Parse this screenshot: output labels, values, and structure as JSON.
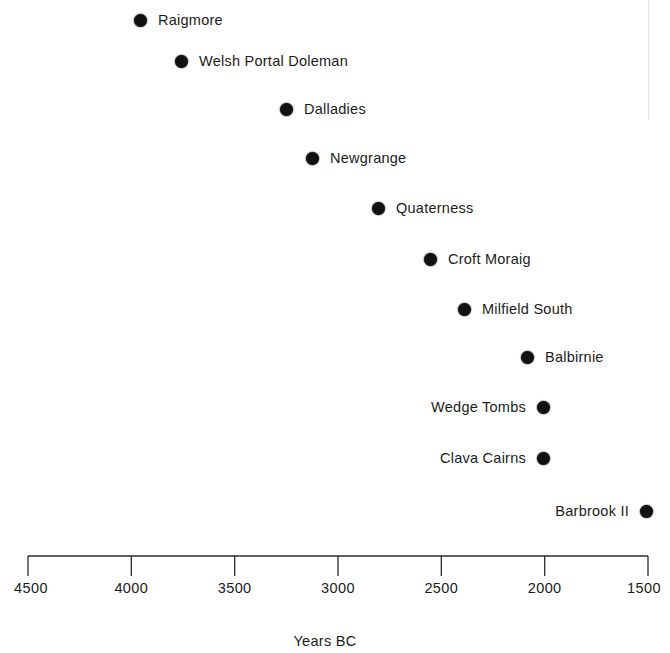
{
  "chart_data": {
    "type": "scatter",
    "title": "",
    "subtitle": "",
    "xlabel": "Years BC",
    "ylabel": "",
    "xlim": [
      4500,
      1500
    ],
    "x_inverted": true,
    "grid": false,
    "legend": "none",
    "xtick_labels": [
      "4500",
      "4000",
      "3500",
      "3000",
      "2500",
      "2000",
      "1500"
    ],
    "xticks": [
      4500,
      4000,
      3500,
      3000,
      2500,
      2000,
      1500
    ],
    "marker_shape": "filled-circle",
    "marker_color": "#111111",
    "categories": [
      "Raigmore",
      "Welsh Portal Doleman",
      "Dalladies",
      "Newgrange",
      "Quaterness",
      "Croft Moraig",
      "Milfield South",
      "Balbirnie",
      "Wedge Tombs",
      "Clava Cairns",
      "Barbrook II"
    ],
    "values": [
      3955,
      3760,
      3250,
      3125,
      2810,
      2555,
      2390,
      2085,
      2010,
      2010,
      1510
    ],
    "points": [
      {
        "label": "Raigmore",
        "value": 3955,
        "x_px": 140,
        "y_px": 20,
        "label_side": "right"
      },
      {
        "label": "Welsh Portal Doleman",
        "value": 3760,
        "x_px": 181,
        "y_px": 61,
        "label_side": "right"
      },
      {
        "label": "Dalladies",
        "value": 3250,
        "x_px": 286,
        "y_px": 109,
        "label_side": "right"
      },
      {
        "label": "Newgrange",
        "value": 3125,
        "x_px": 312,
        "y_px": 158,
        "label_side": "right"
      },
      {
        "label": "Quaterness",
        "value": 2810,
        "x_px": 378,
        "y_px": 208,
        "label_side": "right"
      },
      {
        "label": "Croft Moraig",
        "value": 2555,
        "x_px": 430,
        "y_px": 259,
        "label_side": "right"
      },
      {
        "label": "Milfield South",
        "value": 2390,
        "x_px": 464,
        "y_px": 309,
        "label_side": "right"
      },
      {
        "label": "Balbirnie",
        "value": 2085,
        "x_px": 527,
        "y_px": 357,
        "label_side": "right"
      },
      {
        "label": "Wedge Tombs",
        "value": 2010,
        "x_px": 543,
        "y_px": 407,
        "label_side": "left"
      },
      {
        "label": "Clava Cairns",
        "value": 2010,
        "x_px": 543,
        "y_px": 458,
        "label_side": "left"
      },
      {
        "label": "Barbrook II",
        "value": 1510,
        "x_px": 646,
        "y_px": 511,
        "label_side": "left"
      }
    ],
    "axis_geometry": {
      "x_start_px": 28,
      "x_end_px": 648,
      "baseline_y_px": 16,
      "tick_length_px": 20
    }
  }
}
